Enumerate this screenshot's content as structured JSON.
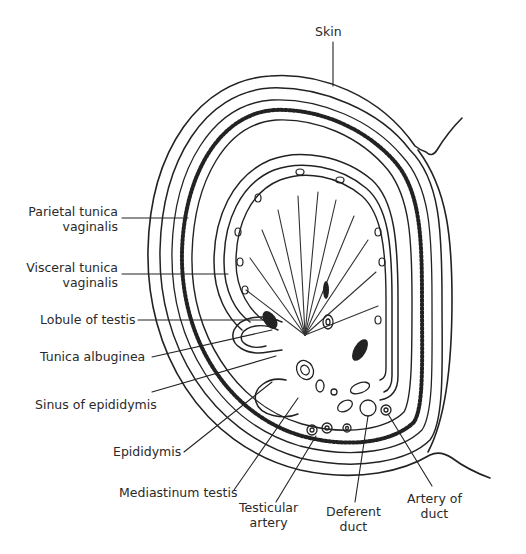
{
  "figure": {
    "colors": {
      "ink": "#222222",
      "background": "#ffffff",
      "label_text": "#2a2a2a"
    }
  },
  "labels": {
    "skin": "Skin",
    "parietal_tunica_vaginalis": [
      "Parietal tunica",
      "vaginalis"
    ],
    "visceral_tunica_vaginalis": [
      "Visceral tunica",
      "vaginalis"
    ],
    "lobule_of_testis": "Lobule of testis",
    "tunica_albuginea": "Tunica albuginea",
    "sinus_of_epididymis": "Sinus of epididymis",
    "epididymis": "Epididymis",
    "mediastinum_testis": "Mediastinum testis",
    "testicular_artery": [
      "Testicular",
      "artery"
    ],
    "deferent_duct": [
      "Deferent",
      "duct"
    ],
    "artery_of_duct": [
      "Artery of",
      "duct"
    ]
  }
}
